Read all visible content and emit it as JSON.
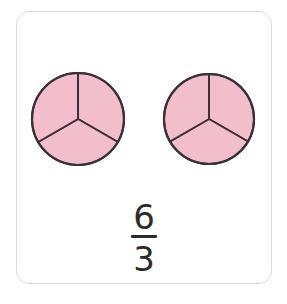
{
  "card": {
    "name": "fraction-model-card",
    "background_color": "#ffffff",
    "border_color": "#dcdcdc",
    "corner_radius_px": 13
  },
  "visual_model": {
    "type": "fraction-circles",
    "shape": "circle",
    "model_count": 2,
    "parts_per_model": 3,
    "shaded_parts_per_model": 3,
    "total_parts": 6,
    "total_shaded": 6,
    "fill_color": "#f2becb",
    "outline_color": "#3a3038",
    "outline_width_px": 2,
    "models": [
      {
        "label": "left-circle",
        "parts": 3,
        "shaded": 3,
        "wedges": [
          {
            "label": "wedge-top-right",
            "shaded": true
          },
          {
            "label": "wedge-bottom",
            "shaded": true
          },
          {
            "label": "wedge-top-left",
            "shaded": true
          }
        ]
      },
      {
        "label": "right-circle",
        "parts": 3,
        "shaded": 3,
        "wedges": [
          {
            "label": "wedge-top-right",
            "shaded": true
          },
          {
            "label": "wedge-bottom",
            "shaded": true
          },
          {
            "label": "wedge-top-left",
            "shaded": true
          }
        ]
      }
    ]
  },
  "fraction": {
    "numerator": "6",
    "denominator": "3",
    "text": "6/3",
    "color": "#2b2b2b"
  }
}
